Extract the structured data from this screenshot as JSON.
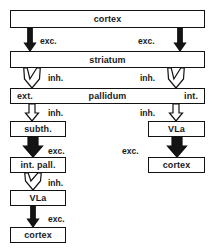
{
  "diagram": {
    "colors": {
      "excitatory_fill": "#141414",
      "inhibitory_fill": "#ffffff",
      "stroke": "#111111",
      "box_fill": "#ffffff",
      "background": "#ffffff"
    },
    "nodes": [
      {
        "id": "cortex_top",
        "label": "cortex",
        "x": 10,
        "y": 10,
        "w": 195,
        "h": 18
      },
      {
        "id": "striatum",
        "label": "striatum",
        "x": 10,
        "y": 51,
        "w": 195,
        "h": 17
      },
      {
        "id": "pallidum",
        "label": "pallidum",
        "left_label": "ext.",
        "right_label": "int.",
        "x": 10,
        "y": 88,
        "w": 195,
        "h": 16
      },
      {
        "id": "subth",
        "label": "subth.",
        "x": 10,
        "y": 121,
        "w": 56,
        "h": 16
      },
      {
        "id": "int_pall",
        "label": "int. pall.",
        "x": 10,
        "y": 157,
        "w": 56,
        "h": 16
      },
      {
        "id": "vla_left",
        "label": "VLa",
        "x": 10,
        "y": 190,
        "w": 56,
        "h": 16
      },
      {
        "id": "cortex_left",
        "label": "cortex",
        "x": 10,
        "y": 227,
        "w": 56,
        "h": 16
      },
      {
        "id": "vla_right",
        "label": "VLa",
        "x": 148,
        "y": 121,
        "w": 57,
        "h": 16
      },
      {
        "id": "cortex_right",
        "label": "cortex",
        "x": 148,
        "y": 157,
        "w": 57,
        "h": 16
      }
    ],
    "edges": [
      {
        "id": "cortex-to-striatum-left",
        "from": "cortex_top",
        "to": "striatum",
        "label": "exc.",
        "kind": "excitatory",
        "style": "solid-thin",
        "label_x": 40,
        "label_y": 36
      },
      {
        "id": "cortex-to-striatum-right",
        "from": "cortex_top",
        "to": "striatum",
        "label": "exc.",
        "kind": "excitatory",
        "style": "solid-thin",
        "label_x": 138,
        "label_y": 36
      },
      {
        "id": "striatum-to-pallidum-ext",
        "from": "striatum",
        "to": "pallidum",
        "label": "inh.",
        "kind": "inhibitory",
        "style": "hollow-fork",
        "label_x": 48,
        "label_y": 73
      },
      {
        "id": "striatum-to-pallidum-int",
        "from": "striatum",
        "to": "pallidum",
        "label": "inh.",
        "kind": "inhibitory",
        "style": "hollow-fork",
        "label_x": 140,
        "label_y": 73
      },
      {
        "id": "ext-to-subth",
        "from": "pallidum",
        "to": "subth",
        "label": "inh.",
        "kind": "inhibitory",
        "style": "hollow",
        "label_x": 48,
        "label_y": 108
      },
      {
        "id": "int-to-vla",
        "from": "pallidum",
        "to": "vla_right",
        "label": "inh.",
        "kind": "inhibitory",
        "style": "hollow",
        "label_x": 140,
        "label_y": 108
      },
      {
        "id": "subth-to-intpall",
        "from": "subth",
        "to": "int_pall",
        "label": "exc.",
        "kind": "excitatory",
        "style": "solid-thick",
        "label_x": 48,
        "label_y": 146
      },
      {
        "id": "vla-right-to-cortex",
        "from": "vla_right",
        "to": "cortex_right",
        "label": "exc.",
        "kind": "excitatory",
        "style": "solid-thick",
        "label_x": 122,
        "label_y": 146
      },
      {
        "id": "intpall-to-vla",
        "from": "int_pall",
        "to": "vla_left",
        "label": "inh.",
        "kind": "inhibitory",
        "style": "hollow-fork",
        "label_x": 48,
        "label_y": 178
      },
      {
        "id": "vla-left-to-cortex",
        "from": "vla_left",
        "to": "cortex_left",
        "label": "exc.",
        "kind": "excitatory",
        "style": "solid-thin",
        "label_x": 48,
        "label_y": 214
      }
    ]
  }
}
